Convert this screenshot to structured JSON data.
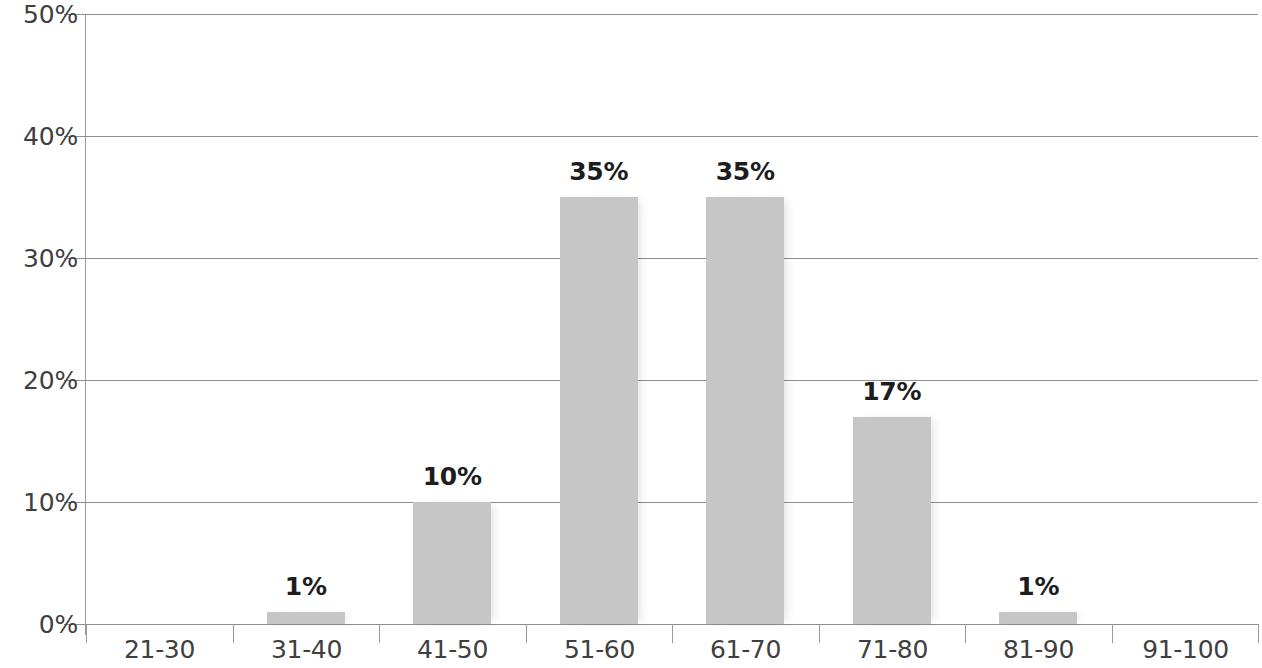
{
  "chart_data": {
    "type": "bar",
    "title": "",
    "subtitle": "",
    "xlabel": "",
    "ylabel": "",
    "categories": [
      "21-30",
      "31-40",
      "41-50",
      "51-60",
      "61-70",
      "71-80",
      "81-90",
      "91-100"
    ],
    "values": [
      0,
      1,
      10,
      35,
      35,
      17,
      1,
      0
    ],
    "data_labels": [
      "",
      "1%",
      "10%",
      "35%",
      "35%",
      "17%",
      "1%",
      ""
    ],
    "ylim": [
      0,
      50
    ],
    "ytick_values": [
      0,
      10,
      20,
      30,
      40,
      50
    ],
    "ytick_labels": [
      "0%",
      "10%",
      "20%",
      "30%",
      "40%",
      "50%"
    ],
    "grid": true,
    "grid_axis": "y",
    "legend": false,
    "legend_position": "none",
    "units": "percent",
    "bar_color": "#c6c6c6",
    "gridline_color": "#8d8d8d",
    "axis_color": "#9a9a9a",
    "label_color": "#3f3f3f",
    "value_label_color": "#1d1d1d"
  }
}
